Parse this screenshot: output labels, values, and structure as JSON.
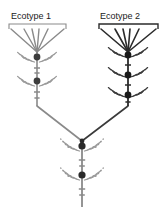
{
  "figure": {
    "width": 165,
    "height": 215,
    "background": "#ffffff",
    "type": "phylogenetic-branching-diagram"
  },
  "labels": {
    "ecotype_1": "Ecotype 1",
    "ecotype_2": "Ecotype 2"
  },
  "colors": {
    "ecotype_1_stroke": "#8a8a8a",
    "ecotype_1_node": "#3d3d3d",
    "ecotype_1_leaf": "#9a9a9a",
    "ecotype_2_stroke": "#2b2b2b",
    "ecotype_2_node": "#1a1a1a",
    "ecotype_2_leaf": "#3a3a3a",
    "basal_stroke": "#8a8a8a",
    "basal_node": "#2a2a2a",
    "basal_leaf": "#9a9a9a",
    "junction_stroke": "#6a6a6a",
    "text": "#1b1b1b",
    "bracket_1": "#8a8a8a",
    "bracket_2": "#2b2b2b"
  },
  "brackets": [
    {
      "name": "bracket-ecotype-1",
      "x_left": 9,
      "x_right": 66,
      "y": 24,
      "tick_height": 5,
      "stroke": "#8a8a8a",
      "stroke_width": 1.1
    },
    {
      "name": "bracket-ecotype-2",
      "x_left": 99,
      "x_right": 158,
      "y": 24,
      "tick_height": 5,
      "stroke": "#2b2b2b",
      "stroke_width": 1.4
    }
  ],
  "fans": [
    {
      "name": "fan-ecotype-1",
      "apex_x": 37,
      "apex_y": 52,
      "stroke": "#8a8a8a",
      "stroke_width": 1.4,
      "ray_count": 6,
      "ray_tops": [
        {
          "x": 11,
          "y": 29
        },
        {
          "x": 24,
          "y": 29
        },
        {
          "x": 32,
          "y": 29
        },
        {
          "x": 39,
          "y": 29
        },
        {
          "x": 48,
          "y": 29
        },
        {
          "x": 64,
          "y": 29
        }
      ]
    },
    {
      "name": "fan-ecotype-2",
      "apex_x": 128,
      "apex_y": 52,
      "stroke": "#2b2b2b",
      "stroke_width": 1.6,
      "ray_count": 6,
      "ray_tops": [
        {
          "x": 101,
          "y": 29
        },
        {
          "x": 115,
          "y": 29
        },
        {
          "x": 123,
          "y": 29
        },
        {
          "x": 130,
          "y": 29
        },
        {
          "x": 139,
          "y": 29
        },
        {
          "x": 156,
          "y": 29
        }
      ]
    }
  ],
  "stems": [
    {
      "name": "stem-ecotype-1",
      "x": 37,
      "y_top": 50,
      "y_bottom": 106,
      "stroke": "#8a8a8a",
      "stroke_width": 1.6,
      "nodes": [
        {
          "y": 57,
          "radius": 3.4,
          "fill": "#3d3d3d"
        },
        {
          "y": 81,
          "radius": 3.4,
          "fill": "#3d3d3d"
        }
      ],
      "ticks": [
        {
          "y": 68,
          "half_width": 3.0
        },
        {
          "y": 73,
          "half_width": 2.6
        },
        {
          "y": 92,
          "half_width": 3.0
        },
        {
          "y": 98,
          "half_width": 2.6
        }
      ],
      "leaf_whorls": [
        {
          "y": 62,
          "count": 8,
          "length": 11,
          "spread": 24
        },
        {
          "y": 86,
          "count": 8,
          "length": 11,
          "spread": 24
        }
      ]
    },
    {
      "name": "stem-ecotype-2",
      "x": 128,
      "y_top": 50,
      "y_bottom": 106,
      "stroke": "#2b2b2b",
      "stroke_width": 1.8,
      "nodes": [
        {
          "y": 55,
          "radius": 3.4,
          "fill": "#1a1a1a"
        },
        {
          "y": 75,
          "radius": 3.4,
          "fill": "#1a1a1a"
        },
        {
          "y": 95,
          "radius": 3.4,
          "fill": "#1a1a1a"
        }
      ],
      "ticks": [
        {
          "y": 65,
          "half_width": 3.0
        },
        {
          "y": 85,
          "half_width": 3.0
        },
        {
          "y": 102,
          "half_width": 2.6
        }
      ],
      "leaf_whorls": [
        {
          "y": 57,
          "count": 8,
          "length": 11,
          "spread": 22
        },
        {
          "y": 77,
          "count": 8,
          "length": 11,
          "spread": 22
        },
        {
          "y": 97,
          "count": 8,
          "length": 11,
          "spread": 22
        }
      ]
    },
    {
      "name": "stem-basal",
      "x": 82,
      "y_top": 141,
      "y_bottom": 207,
      "stroke": "#8a8a8a",
      "stroke_width": 1.8,
      "nodes": [
        {
          "y": 146,
          "radius": 3.6,
          "fill": "#2a2a2a"
        },
        {
          "y": 175,
          "radius": 3.6,
          "fill": "#2a2a2a"
        }
      ],
      "ticks": [
        {
          "y": 160,
          "half_width": 3.2
        },
        {
          "y": 166,
          "half_width": 2.8
        },
        {
          "y": 189,
          "half_width": 3.2
        },
        {
          "y": 195,
          "half_width": 2.8
        }
      ],
      "leaf_whorls": [
        {
          "y": 151,
          "count": 8,
          "length": 12,
          "spread": 26
        },
        {
          "y": 180,
          "count": 8,
          "length": 12,
          "spread": 26
        }
      ]
    }
  ],
  "junction": {
    "name": "v-junction",
    "left_x": 37,
    "right_x": 128,
    "shoulder_y": 106,
    "apex_x": 82,
    "apex_y": 141,
    "left_stroke": "#8a8a8a",
    "right_stroke": "#3a3a3a",
    "stroke_width": 1.6,
    "apex_node": {
      "radius": 2.4,
      "fill": "#2a2a2a"
    }
  }
}
